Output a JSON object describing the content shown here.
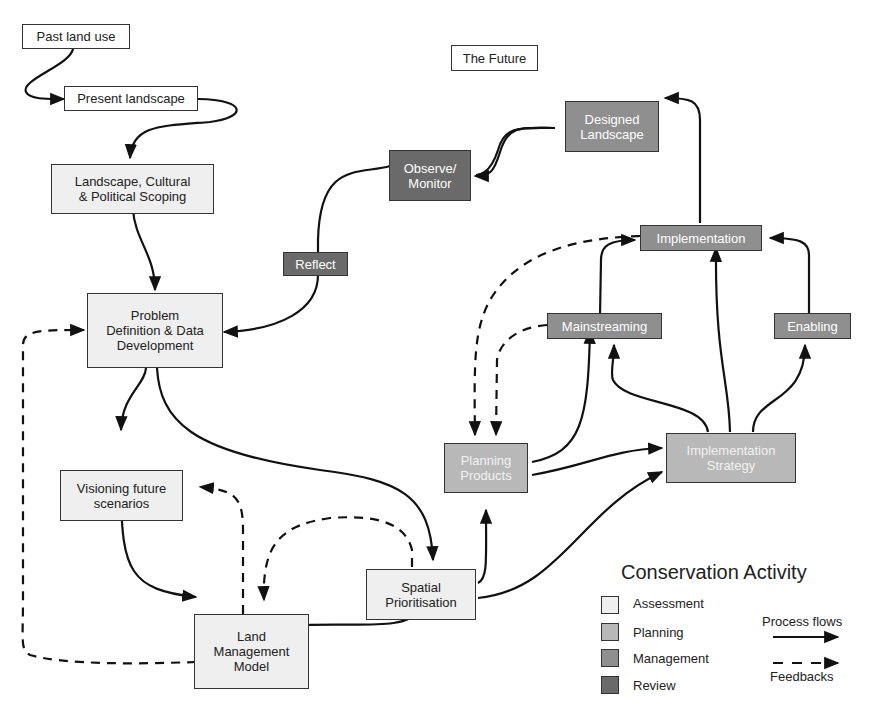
{
  "nodes": {
    "past_land_use": "Past land use",
    "present_landscape": "Present landscape",
    "the_future": "The Future",
    "scoping": "Landscape, Cultural\n& Political Scoping",
    "problem_definition": "Problem\nDefinition & Data\nDevelopment",
    "visioning": "Visioning future\nscenarios",
    "land_management_model": "Land\nManagement\nModel",
    "spatial_prioritisation": "Spatial\nPrioritisation",
    "planning_products": "Planning\nProducts",
    "implementation_strategy": "Implementation\nStrategy",
    "mainstreaming": "Mainstreaming",
    "enabling": "Enabling",
    "implementation": "Implementation",
    "designed_landscape": "Designed\nLandscape",
    "observe_monitor": "Observe/\nMonitor",
    "reflect": "Reflect"
  },
  "legend": {
    "title": "Conservation Activity",
    "categories": [
      {
        "label": "Assessment",
        "color": "#efefef"
      },
      {
        "label": "Planning",
        "color": "#b8b8b8"
      },
      {
        "label": "Management",
        "color": "#8f8f8f"
      },
      {
        "label": "Review",
        "color": "#6a6a6a"
      }
    ],
    "process_flows": "Process flows",
    "feedbacks": "Feedbacks"
  }
}
